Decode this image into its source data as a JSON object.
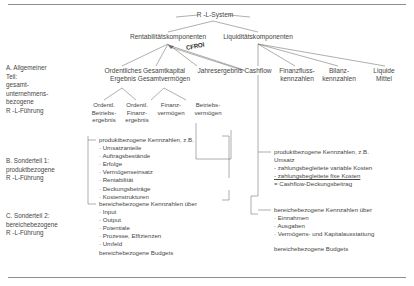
{
  "diagram": {
    "title": "R -L-System",
    "edge_label": "CFROI",
    "level1": [
      {
        "label": "Rentabilitätskomponenten"
      },
      {
        "label": "Liquiditätskomponenten"
      }
    ],
    "level2_left": [
      {
        "line1": "Ordentliches",
        "line2": "Ergebnis"
      },
      {
        "line1": "Gesamtkapital",
        "line2": "Gesamtvermögen"
      },
      {
        "line1": "Jahresergebnis",
        "line2": ""
      }
    ],
    "level2_right": [
      {
        "line1": "Cashflow",
        "line2": ""
      },
      {
        "line1": "Finanzfluss-",
        "line2": "kennzahlen"
      },
      {
        "line1": "Bilanz-",
        "line2": "kennzahlen"
      },
      {
        "line1": "Liquide",
        "line2": "Mittel"
      }
    ],
    "level3": [
      {
        "line1": "Ordentl.",
        "line2": "Betriebs-",
        "line3": "ergebnis"
      },
      {
        "line1": "Ordentl.",
        "line2": "Finanz-",
        "line3": "ergebnis"
      },
      {
        "line1": "Finanz-",
        "line2": "vermögen",
        "line3": ""
      },
      {
        "line1": "Betriebs-",
        "line2": "vermögen",
        "line3": ""
      }
    ]
  },
  "sections": [
    {
      "id": "A",
      "lines": "A. Allgemeiner\nTeil:\ngesamt-\nunternehmens-\nbezogene\nR -L-Führung"
    },
    {
      "id": "B",
      "lines": "B. Sonderteil 1:\nproduktbezogene\nR -L-Führung"
    },
    {
      "id": "C",
      "lines": "C. Sonderteil 2:\nbereichebezogene\nR -L-Führung"
    }
  ],
  "lists": {
    "left_product": {
      "heading": "produktbezogene Kennzahlen, z.B.",
      "items": [
        "· Umsatzanteile",
        "· Auftragsbestände",
        "· Erfolge",
        "· Vermögenseinsatz",
        "· Rentabilität",
        "· Deckungsbeträge",
        "· Kostenstrukturen"
      ]
    },
    "left_area": {
      "heading": "bereichebezogene Kennzahlen über",
      "items": [
        "· Input",
        "· Output",
        "· Potentiale",
        "· Prozesse, Effizienzen",
        "· Umfeld"
      ],
      "footer": "bereichebezogene Budgets"
    },
    "right_product": {
      "heading": "produktbezogene Kennzahlen, z.B.",
      "items": [
        "Umsatz",
        "- zahlungsbegleitete variable Kosten",
        "- zahlungsbegleitete fixe Kosten",
        "= Cashflow-Deckungsbeitrag"
      ],
      "underline_index": 2
    },
    "right_area": {
      "heading": "bereichebezogene Kennzahlen über",
      "items": [
        "· Einnahmen",
        "· Ausgaben",
        "· Vermögens- und Kapitalausstattung"
      ],
      "footer": "bereichebezogene Budgets"
    }
  }
}
